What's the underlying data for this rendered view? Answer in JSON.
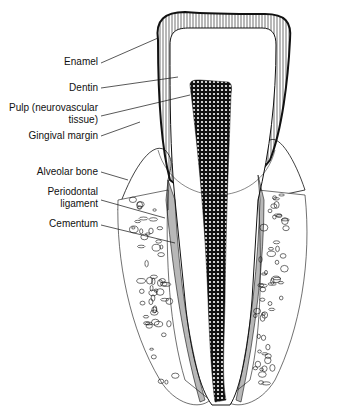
{
  "labels": [
    {
      "id": "enamel",
      "lines": [
        "Enamel"
      ]
    },
    {
      "id": "dentin",
      "lines": [
        "Dentin"
      ]
    },
    {
      "id": "pulp",
      "lines": [
        "Pulp (neurovascular",
        "tissue)"
      ]
    },
    {
      "id": "gingival-margin",
      "lines": [
        "Gingival margin"
      ]
    },
    {
      "id": "alveolar-bone",
      "lines": [
        "Alveolar bone"
      ]
    },
    {
      "id": "periodontal-ligament",
      "lines": [
        "Periodontal",
        "ligament"
      ]
    },
    {
      "id": "cementum",
      "lines": [
        "Cementum"
      ]
    }
  ],
  "colors": {
    "ink": "#111111",
    "paper": "#ffffff"
  }
}
